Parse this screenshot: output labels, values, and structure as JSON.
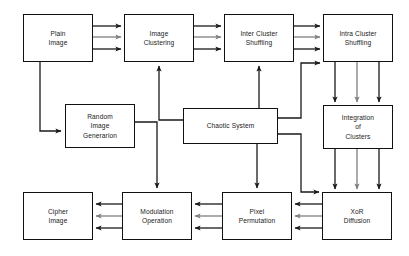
{
  "diagram": {
    "type": "flowchart",
    "canvas": {
      "width": 409,
      "height": 256,
      "background": "#ffffff"
    },
    "colors": {
      "box_border": "#111111",
      "box_fill": "#ffffff",
      "arrow_dark": "#1a1a1a",
      "arrow_gray": "#7f7f7f",
      "text": "#1a1a1a"
    },
    "nodes": [
      {
        "id": "plain-image",
        "label": "Plain\nImage",
        "x": 23,
        "y": 14,
        "w": 70,
        "h": 48
      },
      {
        "id": "image-clustering",
        "label": "Image\nClustering",
        "x": 124,
        "y": 14,
        "w": 70,
        "h": 48
      },
      {
        "id": "inter-cluster",
        "label": "Inter Cluster\nShuffling",
        "x": 224,
        "y": 14,
        "w": 70,
        "h": 48
      },
      {
        "id": "intra-cluster",
        "label": "Intra Cluster\nShuffling",
        "x": 323,
        "y": 14,
        "w": 70,
        "h": 48
      },
      {
        "id": "random-image",
        "label": "Random\nImage\nGenerarion",
        "x": 65,
        "y": 104,
        "w": 70,
        "h": 44
      },
      {
        "id": "chaotic-system",
        "label": "Chaotic System",
        "x": 183,
        "y": 108,
        "w": 95,
        "h": 36
      },
      {
        "id": "integration",
        "label": "Integration\nof\nClusters",
        "x": 323,
        "y": 105,
        "w": 70,
        "h": 44
      },
      {
        "id": "cipher-image",
        "label": "Cipher\nImage",
        "x": 23,
        "y": 192,
        "w": 70,
        "h": 48
      },
      {
        "id": "modulation",
        "label": "Modulation\nOperation",
        "x": 122,
        "y": 192,
        "w": 70,
        "h": 48
      },
      {
        "id": "pixel-permutation",
        "label": "Pixel\nPermutation",
        "x": 222,
        "y": 192,
        "w": 70,
        "h": 48
      },
      {
        "id": "xor-diffusion",
        "label": "XoR\nDiffusion",
        "x": 322,
        "y": 192,
        "w": 70,
        "h": 48
      }
    ],
    "edges": [
      {
        "id": "plain-to-clustering",
        "from": "plain-image",
        "to": "image-clustering",
        "style": "triple-bus",
        "direction": "right"
      },
      {
        "id": "clustering-to-inter",
        "from": "image-clustering",
        "to": "inter-cluster",
        "style": "triple-bus",
        "direction": "right"
      },
      {
        "id": "inter-to-intra",
        "from": "inter-cluster",
        "to": "intra-cluster",
        "style": "triple-bus",
        "direction": "right"
      },
      {
        "id": "intra-to-integration",
        "from": "intra-cluster",
        "to": "integration",
        "style": "triple-bus",
        "direction": "down"
      },
      {
        "id": "integration-to-xor",
        "from": "integration",
        "to": "xor-diffusion",
        "style": "triple-bus",
        "direction": "down"
      },
      {
        "id": "xor-to-permutation",
        "from": "xor-diffusion",
        "to": "pixel-permutation",
        "style": "triple-bus",
        "direction": "left"
      },
      {
        "id": "permutation-to-modulation",
        "from": "pixel-permutation",
        "to": "modulation",
        "style": "triple-bus",
        "direction": "left"
      },
      {
        "id": "modulation-to-cipher",
        "from": "modulation",
        "to": "cipher-image",
        "style": "triple-bus",
        "direction": "left"
      },
      {
        "id": "plain-to-random",
        "from": "plain-image",
        "to": "random-image",
        "style": "single",
        "direction": "right"
      },
      {
        "id": "random-to-modulation",
        "from": "random-image",
        "to": "modulation",
        "style": "single",
        "direction": "down"
      },
      {
        "id": "chaotic-to-clustering",
        "from": "chaotic-system",
        "to": "image-clustering",
        "style": "single",
        "direction": "up"
      },
      {
        "id": "chaotic-to-inter",
        "from": "chaotic-system",
        "to": "inter-cluster",
        "style": "single",
        "direction": "up"
      },
      {
        "id": "chaotic-to-intra",
        "from": "chaotic-system",
        "to": "intra-cluster",
        "style": "single",
        "direction": "up"
      },
      {
        "id": "chaotic-to-permutation",
        "from": "chaotic-system",
        "to": "pixel-permutation",
        "style": "single",
        "direction": "down"
      },
      {
        "id": "chaotic-to-xor",
        "from": "chaotic-system",
        "to": "xor-diffusion",
        "style": "single",
        "direction": "down"
      }
    ]
  }
}
